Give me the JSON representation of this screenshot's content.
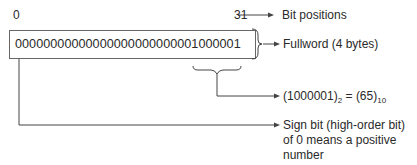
{
  "diagram": {
    "bit_start": "0",
    "bit_end": "31",
    "bit_positions_label": "Bit positions",
    "word_bits": "00000000000000000000000001000001",
    "fullword_label": "Fullword (4 bytes)",
    "binary_value": "(1000001)",
    "binary_base": "2",
    "equals": "=",
    "decimal_value": "(65)",
    "decimal_base": "10",
    "sign_bit_label_line1": "Sign bit (high-order bit)",
    "sign_bit_label_line2": "of 0 means a positive",
    "sign_bit_label_line3": "number"
  },
  "colors": {
    "line": "#555555",
    "text": "#2a2a2a"
  }
}
